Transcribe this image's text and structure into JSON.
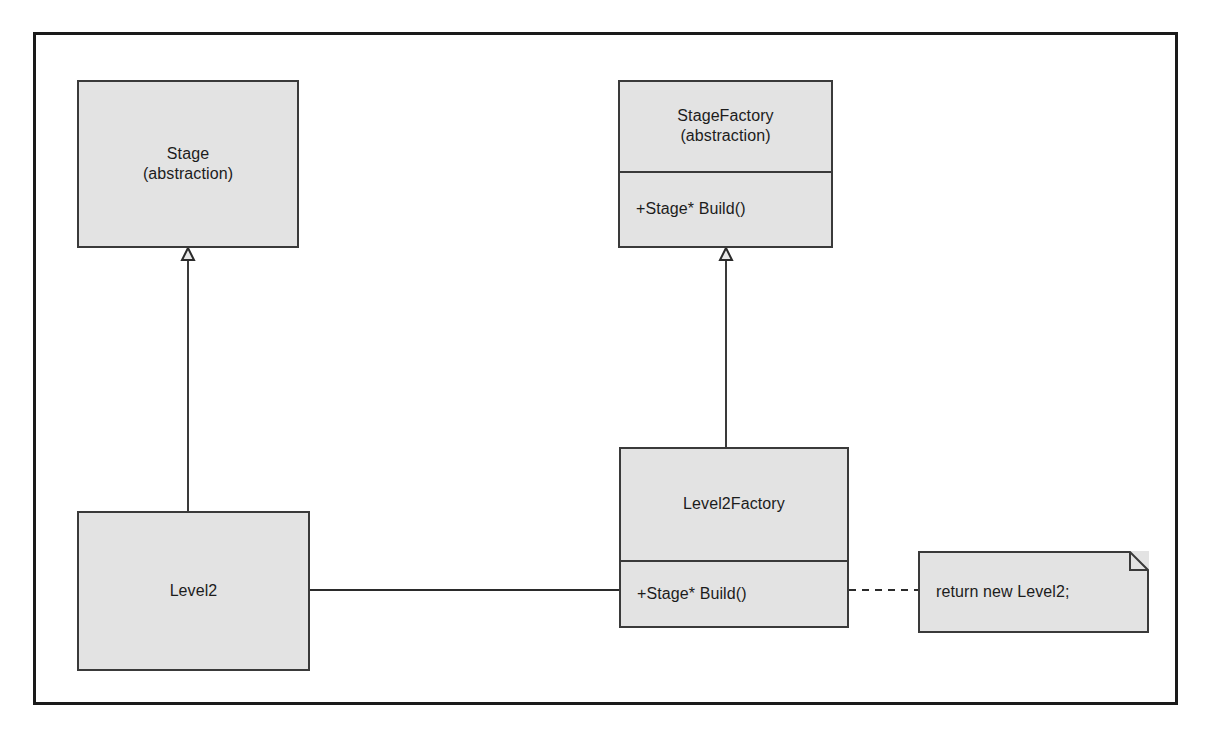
{
  "diagram": {
    "type": "uml-class-diagram",
    "background_color": "#ffffff",
    "frame_border_color": "#1a1a1a",
    "box_fill_color": "#e3e3e3",
    "box_border_color": "#3a3a3a",
    "text_color": "#1c1c1c",
    "classes": [
      {
        "id": "stage",
        "name": "Stage",
        "stereotype": "(abstraction)",
        "members": [],
        "x": 74,
        "y": 77,
        "w": 222,
        "h": 168,
        "title_h": 168
      },
      {
        "id": "stage-factory",
        "name": "StageFactory",
        "stereotype": "(abstraction)",
        "members": [
          "+Stage* Build()"
        ],
        "x": 615,
        "y": 77,
        "w": 215,
        "h": 168,
        "title_h": 91
      },
      {
        "id": "level2-factory",
        "name": "Level2Factory",
        "stereotype": "",
        "members": [
          "+Stage* Build()"
        ],
        "x": 616,
        "y": 444,
        "w": 230,
        "h": 181,
        "title_h": 114
      },
      {
        "id": "level2",
        "name": "Level2",
        "stereotype": "",
        "members": [],
        "x": 74,
        "y": 508,
        "w": 233,
        "h": 160,
        "title_h": 160
      }
    ],
    "note": {
      "id": "note-return-new-level2",
      "text": "return new Level2;",
      "x": 915,
      "y": 548,
      "w": 231,
      "h": 82,
      "fold": 18
    },
    "connectors": [
      {
        "id": "generalization-level2-to-stage",
        "kind": "generalization",
        "label": "",
        "from": "level2",
        "to": "stage",
        "style": "solid",
        "arrowhead": "hollow-triangle"
      },
      {
        "id": "generalization-level2factory-to-stagefactory",
        "kind": "generalization",
        "label": "",
        "from": "level2-factory",
        "to": "stage-factory",
        "style": "solid",
        "arrowhead": "hollow-triangle"
      },
      {
        "id": "dependency-level2factory-to-level2",
        "kind": "dependency",
        "label": "",
        "from": "level2-factory",
        "to": "level2",
        "style": "solid",
        "arrowhead": "filled-arrow"
      },
      {
        "id": "note-anchor-level2factory",
        "kind": "note-anchor",
        "label": "",
        "from": "level2-factory",
        "to": "note-return-new-level2",
        "style": "dashed",
        "arrowhead": "none"
      }
    ]
  }
}
